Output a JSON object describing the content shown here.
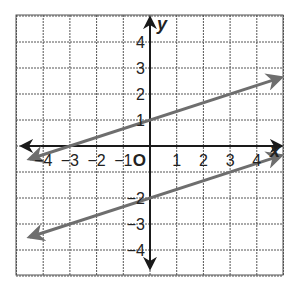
{
  "chart_data": {
    "type": "line",
    "title": "",
    "xlabel": "x",
    "ylabel": "y",
    "origin_label": "O",
    "xlim": [
      -4.5,
      4.9
    ],
    "ylim": [
      -4.8,
      4.8
    ],
    "grid": true,
    "x_ticks": [
      {
        "value": -4,
        "label": "−4"
      },
      {
        "value": -3,
        "label": "−3"
      },
      {
        "value": -2,
        "label": "−2"
      },
      {
        "value": -1,
        "label": "−1"
      },
      {
        "value": 1,
        "label": "1"
      },
      {
        "value": 2,
        "label": "2"
      },
      {
        "value": 3,
        "label": "3"
      },
      {
        "value": 4,
        "label": "4"
      }
    ],
    "y_ticks": [
      {
        "value": 4,
        "label": "4"
      },
      {
        "value": 3,
        "label": "3"
      },
      {
        "value": 2,
        "label": "2"
      },
      {
        "value": 1,
        "label": "1"
      },
      {
        "value": -2,
        "label": "−2"
      },
      {
        "value": -3,
        "label": "−3"
      },
      {
        "value": -4,
        "label": "−4"
      }
    ],
    "series": [
      {
        "name": "upper line",
        "equation": "y = (1/3)x + 1",
        "slope": 0.3333,
        "intercept": 1,
        "x": [
          -4.5,
          4.9
        ],
        "y": [
          -0.5,
          2.63
        ],
        "color": "#6e6e6e",
        "arrows": "both"
      },
      {
        "name": "lower line",
        "equation": "y = (1/3)x - 2",
        "slope": 0.3333,
        "intercept": -2,
        "x": [
          -4.5,
          4.9
        ],
        "y": [
          -3.5,
          -0.37
        ],
        "color": "#6e6e6e",
        "arrows": "both"
      }
    ]
  },
  "colors": {
    "grid": "#555555",
    "axis": "#1a1a1a",
    "line": "#6e6e6e"
  }
}
